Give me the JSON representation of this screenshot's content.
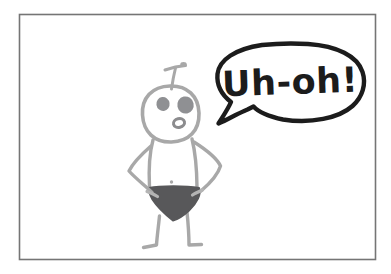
{
  "panel": {
    "kind": "hand-drawn cartoon panel",
    "speech_bubble": {
      "text": "Uh-oh!"
    }
  },
  "colors": {
    "page_background": "#ffffff",
    "frame_border": "#757575",
    "figure_line": "#a8a8a8",
    "eye_fill": "#8f9093",
    "mouth_line": "#8c8c8e",
    "underwear_fill": "#58585a",
    "hand_highlight": "#b4b4b4",
    "bubble_fill": "#ffffff",
    "bubble_stroke": "#1c1c1c",
    "speech_text_color": "#1c1c1c"
  }
}
